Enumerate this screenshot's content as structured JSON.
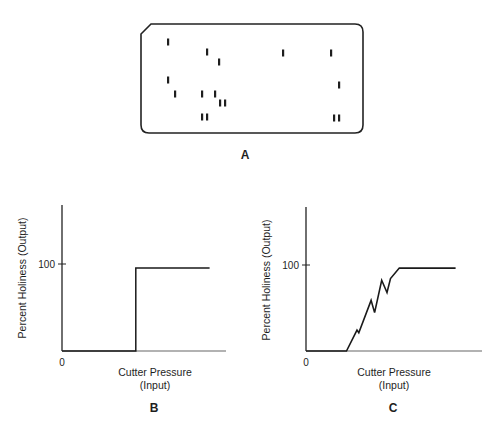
{
  "panel_a": {
    "letter": "A",
    "description": "Punched card with rectangular holes",
    "card": {
      "x": 141,
      "y": 24,
      "width": 222,
      "height": 109,
      "corner_cut": 10,
      "radius": 8
    },
    "holes": [
      {
        "x": 168,
        "y": 42
      },
      {
        "x": 207,
        "y": 52
      },
      {
        "x": 219,
        "y": 62
      },
      {
        "x": 168,
        "y": 80
      },
      {
        "x": 175,
        "y": 94
      },
      {
        "x": 202,
        "y": 94
      },
      {
        "x": 215,
        "y": 94
      },
      {
        "x": 220,
        "y": 103
      },
      {
        "x": 225,
        "y": 103
      },
      {
        "x": 202,
        "y": 117
      },
      {
        "x": 207,
        "y": 117
      },
      {
        "x": 283,
        "y": 53
      },
      {
        "x": 331,
        "y": 53
      },
      {
        "x": 339,
        "y": 85
      },
      {
        "x": 334,
        "y": 118
      },
      {
        "x": 339,
        "y": 118
      }
    ]
  },
  "panel_b": {
    "letter": "B",
    "y_axis_label": "Percent Holiness (Output)",
    "x_axis_label_line1": "Cutter Pressure",
    "x_axis_label_line2": "(Input)",
    "y_tick_label": "100",
    "origin_label": "0"
  },
  "panel_c": {
    "letter": "C",
    "y_axis_label": "Percent Holiness (Output)",
    "x_axis_label_line1": "Cutter Pressure",
    "x_axis_label_line2": "(Input)",
    "y_tick_label": "100",
    "origin_label": "0"
  },
  "chart_data": [
    {
      "type": "line",
      "title": "B",
      "xlabel": "Cutter Pressure (Input)",
      "ylabel": "Percent Holiness (Output)",
      "x_tick_labels": [
        "0"
      ],
      "y_tick_labels": [
        "100"
      ],
      "grid": false,
      "description": "Ideal step response: output 0 until threshold pressure, then jumps to ~95",
      "x": [
        0,
        0.45,
        0.45,
        0.9
      ],
      "y": [
        0,
        0,
        95,
        95
      ],
      "xlim": [
        0,
        1
      ],
      "ylim": [
        0,
        165
      ]
    },
    {
      "type": "line",
      "title": "C",
      "xlabel": "Cutter Pressure (Input)",
      "ylabel": "Percent Holiness (Output)",
      "x_tick_labels": [
        "0"
      ],
      "y_tick_labels": [
        "100"
      ],
      "grid": false,
      "description": "Real-world response: jagged, noisy rise from 0 to ~95 then plateau",
      "x": [
        0,
        0.23,
        0.29,
        0.3,
        0.37,
        0.39,
        0.43,
        0.46,
        0.48,
        0.53,
        0.85
      ],
      "y": [
        0,
        0,
        24,
        21,
        58,
        44,
        81,
        67,
        83,
        95,
        95
      ],
      "xlim": [
        0,
        1
      ],
      "ylim": [
        0,
        165
      ]
    }
  ]
}
